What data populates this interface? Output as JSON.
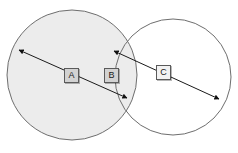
{
  "diagram": {
    "canvas": {
      "width": 238,
      "height": 153,
      "background": "#ffffff"
    },
    "shapes": [
      {
        "name": "left-circle",
        "type": "circle",
        "cx": 72,
        "cy": 75,
        "r": 65,
        "fill": "#ececec",
        "stroke": "#6e6e6e",
        "stroke_width": 1
      },
      {
        "name": "right-circle",
        "type": "circle",
        "cx": 173,
        "cy": 77,
        "r": 58,
        "fill": "none",
        "stroke": "#6e6e6e",
        "stroke_width": 1
      }
    ],
    "arrows": [
      {
        "name": "arrow-a",
        "x1": 19,
        "y1": 50,
        "x2": 127,
        "y2": 98,
        "heads": "both",
        "color": "#1a1a1a",
        "stroke_width": 1
      },
      {
        "name": "arrow-c",
        "x1": 114,
        "y1": 51,
        "x2": 219,
        "y2": 99,
        "heads": "both",
        "color": "#1a1a1a",
        "stroke_width": 1
      }
    ],
    "labels": [
      {
        "name": "label-a",
        "text": "A",
        "x": 64,
        "y": 68,
        "fill": "#d2d2d2"
      },
      {
        "name": "label-b",
        "text": "B",
        "x": 104,
        "y": 68,
        "fill": "#d2d2d2"
      },
      {
        "name": "label-c",
        "text": "C",
        "x": 156,
        "y": 65,
        "fill": "#f2f2f2"
      }
    ]
  }
}
